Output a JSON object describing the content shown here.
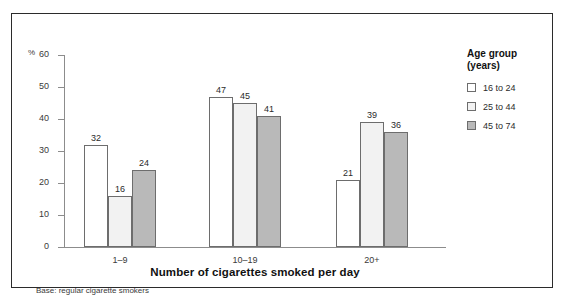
{
  "chart_data": {
    "type": "bar",
    "title": "",
    "xlabel": "Number of cigarettes smoked per day",
    "ylabel": "%",
    "categories": [
      "1–9",
      "10–19",
      "20+"
    ],
    "series": [
      {
        "name": "16 to 24",
        "values": [
          32,
          47,
          21
        ],
        "color": "#ffffff"
      },
      {
        "name": "25 to 44",
        "values": [
          16,
          45,
          39
        ],
        "color": "#f2f2f2"
      },
      {
        "name": "45 to 74",
        "values": [
          24,
          41,
          36
        ],
        "color": "#b9b9b9"
      }
    ],
    "ylim": [
      0,
      60
    ],
    "yticks": [
      0,
      10,
      20,
      30,
      40,
      50,
      60
    ],
    "grid": false,
    "legend_position": "right",
    "legend_title": "Age group\n(years)",
    "footnote": "Base: regular cigarette smokers"
  }
}
